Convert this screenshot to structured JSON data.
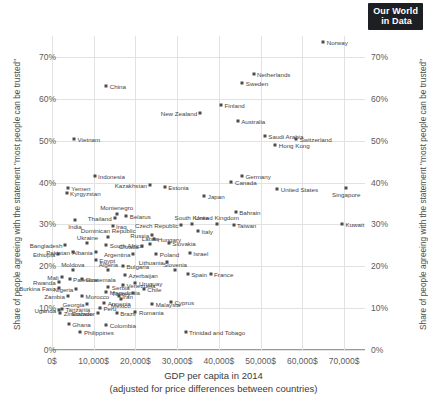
{
  "logo": {
    "line1": "Our World",
    "line2": "in Data"
  },
  "chart_data": {
    "type": "scatter",
    "title": "",
    "xlabel": "GDP per capita in 2014",
    "xlabel_sub": "(adjusted for price differences between countries)",
    "ylabel": "Share of people agreeing with the statement \"most people can be trusted\"",
    "xlim": [
      0,
      75000
    ],
    "ylim": [
      0,
      75
    ],
    "grid": true,
    "legend": "none",
    "xticks": [
      "0$",
      "10,000$",
      "20,000$",
      "30,000$",
      "40,000$",
      "50,000$",
      "60,000$",
      "70,000$"
    ],
    "xtick_values": [
      0,
      10000,
      20000,
      30000,
      40000,
      50000,
      60000,
      70000
    ],
    "yticks": [
      "0%",
      "10%",
      "20%",
      "30%",
      "40%",
      "50%",
      "60%",
      "70%"
    ],
    "ytick_values": [
      0,
      10,
      20,
      30,
      40,
      50,
      60,
      70
    ],
    "points": [
      {
        "name": "Norway",
        "x": 65000,
        "y": 73.5,
        "pos": "r"
      },
      {
        "name": "Netherlands",
        "x": 48300,
        "y": 66.0,
        "pos": "r"
      },
      {
        "name": "Sweden",
        "x": 45600,
        "y": 63.8,
        "pos": "r"
      },
      {
        "name": "China",
        "x": 13000,
        "y": 63.0,
        "pos": "r"
      },
      {
        "name": "Finland",
        "x": 40500,
        "y": 58.5,
        "pos": "r"
      },
      {
        "name": "New Zealand",
        "x": 35500,
        "y": 56.5,
        "pos": "l"
      },
      {
        "name": "Australia",
        "x": 44500,
        "y": 54.8,
        "pos": "r"
      },
      {
        "name": "Saudi Arabia",
        "x": 51000,
        "y": 51.2,
        "pos": "r"
      },
      {
        "name": "Switzerland",
        "x": 58500,
        "y": 50.5,
        "pos": "r"
      },
      {
        "name": "Hong Kong",
        "x": 53500,
        "y": 49.0,
        "pos": "r"
      },
      {
        "name": "Vietnam",
        "x": 5300,
        "y": 50.5,
        "pos": "r"
      },
      {
        "name": "Germany",
        "x": 45500,
        "y": 41.5,
        "pos": "r"
      },
      {
        "name": "Canada",
        "x": 43000,
        "y": 40.2,
        "pos": "r"
      },
      {
        "name": "United States",
        "x": 54000,
        "y": 38.5,
        "pos": "r"
      },
      {
        "name": "Singapore",
        "x": 70500,
        "y": 38.8,
        "pos": "b"
      },
      {
        "name": "Indonesia",
        "x": 10200,
        "y": 41.5,
        "pos": "r"
      },
      {
        "name": "Kazakhstan",
        "x": 23500,
        "y": 39.5,
        "pos": "l"
      },
      {
        "name": "Estonia",
        "x": 27000,
        "y": 39.0,
        "pos": "r"
      },
      {
        "name": "Yemen",
        "x": 3800,
        "y": 38.8,
        "pos": "r"
      },
      {
        "name": "Kyrgyzstan",
        "x": 3500,
        "y": 37.5,
        "pos": "r"
      },
      {
        "name": "Japan",
        "x": 36500,
        "y": 36.8,
        "pos": "r"
      },
      {
        "name": "Bahrain",
        "x": 44000,
        "y": 33.0,
        "pos": "r"
      },
      {
        "name": "Montenegro",
        "x": 15500,
        "y": 32.5,
        "pos": "t"
      },
      {
        "name": "Belarus",
        "x": 17800,
        "y": 32.0,
        "pos": "r"
      },
      {
        "name": "Thailand",
        "x": 15000,
        "y": 31.5,
        "pos": "l"
      },
      {
        "name": "United Kingdom",
        "x": 39500,
        "y": 30.2,
        "pos": "t"
      },
      {
        "name": "South Korea",
        "x": 33500,
        "y": 30.2,
        "pos": "t"
      },
      {
        "name": "Czech Republic",
        "x": 31000,
        "y": 29.8,
        "pos": "l"
      },
      {
        "name": "Taiwan",
        "x": 43500,
        "y": 29.8,
        "pos": "r"
      },
      {
        "name": "India",
        "x": 5500,
        "y": 31.0,
        "pos": "b"
      },
      {
        "name": "Iraq",
        "x": 14500,
        "y": 29.5,
        "pos": "r"
      },
      {
        "name": "Italy",
        "x": 35000,
        "y": 28.5,
        "pos": "r"
      },
      {
        "name": "Kuwait",
        "x": 69500,
        "y": 30.0,
        "pos": "r"
      },
      {
        "name": "Russia",
        "x": 24000,
        "y": 27.5,
        "pos": "l"
      },
      {
        "name": "Dominican Republic",
        "x": 13500,
        "y": 27.0,
        "pos": "t"
      },
      {
        "name": "Hungary",
        "x": 24500,
        "y": 26.5,
        "pos": "r"
      },
      {
        "name": "Latvia",
        "x": 23500,
        "y": 25.2,
        "pos": "t"
      },
      {
        "name": "Slovakia",
        "x": 28000,
        "y": 25.5,
        "pos": "r"
      },
      {
        "name": "South Africa",
        "x": 13000,
        "y": 25.0,
        "pos": "r"
      },
      {
        "name": "Croatia",
        "x": 21500,
        "y": 24.8,
        "pos": "l"
      },
      {
        "name": "Ukraine",
        "x": 8500,
        "y": 25.5,
        "pos": "t"
      },
      {
        "name": "Bangladesh",
        "x": 3200,
        "y": 25.0,
        "pos": "l"
      },
      {
        "name": "Pakistan",
        "x": 5000,
        "y": 23.5,
        "pos": "l"
      },
      {
        "name": "Albania",
        "x": 10500,
        "y": 23.5,
        "pos": "l"
      },
      {
        "name": "Ethiopia",
        "x": 1500,
        "y": 23.0,
        "pos": "l"
      },
      {
        "name": "Poland",
        "x": 25000,
        "y": 23.0,
        "pos": "r"
      },
      {
        "name": "Argentina",
        "x": 19500,
        "y": 23.0,
        "pos": "l"
      },
      {
        "name": "Israel",
        "x": 33000,
        "y": 23.2,
        "pos": "r"
      },
      {
        "name": "Egypt",
        "x": 10500,
        "y": 21.5,
        "pos": "r"
      },
      {
        "name": "Bulgaria",
        "x": 17000,
        "y": 20.0,
        "pos": "r"
      },
      {
        "name": "Lithuania",
        "x": 27500,
        "y": 21.0,
        "pos": "l"
      },
      {
        "name": "Slovenia",
        "x": 29500,
        "y": 19.0,
        "pos": "t"
      },
      {
        "name": "Moldova",
        "x": 5000,
        "y": 19.0,
        "pos": "t"
      },
      {
        "name": "Algeria",
        "x": 13500,
        "y": 19.0,
        "pos": "t"
      },
      {
        "name": "Spain",
        "x": 32500,
        "y": 18.2,
        "pos": "r"
      },
      {
        "name": "France",
        "x": 38000,
        "y": 18.2,
        "pos": "r"
      },
      {
        "name": "Azerbaijan",
        "x": 17500,
        "y": 17.8,
        "pos": "r"
      },
      {
        "name": "Mali",
        "x": 2300,
        "y": 17.5,
        "pos": "l"
      },
      {
        "name": "Palestine",
        "x": 4200,
        "y": 17.0,
        "pos": "r"
      },
      {
        "name": "Guatemala",
        "x": 7200,
        "y": 17.0,
        "pos": "r"
      },
      {
        "name": "Rwanda",
        "x": 1600,
        "y": 16.2,
        "pos": "l"
      },
      {
        "name": "Uruguay",
        "x": 20000,
        "y": 16.0,
        "pos": "r"
      },
      {
        "name": "Venezuela",
        "x": 17000,
        "y": 15.5,
        "pos": "r"
      },
      {
        "name": "Serbia",
        "x": 13500,
        "y": 15.0,
        "pos": "r"
      },
      {
        "name": "Chile",
        "x": 22000,
        "y": 14.5,
        "pos": "r"
      },
      {
        "name": "Nigeria",
        "x": 5800,
        "y": 14.5,
        "pos": "l"
      },
      {
        "name": "Burkina Faso",
        "x": 1600,
        "y": 14.8,
        "pos": "l"
      },
      {
        "name": "Macedonia",
        "x": 13000,
        "y": 13.8,
        "pos": "r"
      },
      {
        "name": "Turkey",
        "x": 19500,
        "y": 13.5,
        "pos": "l"
      },
      {
        "name": "Zambia",
        "x": 3800,
        "y": 13.0,
        "pos": "l"
      },
      {
        "name": "Morocco",
        "x": 7200,
        "y": 12.8,
        "pos": "r"
      },
      {
        "name": "Mexico",
        "x": 16500,
        "y": 12.3,
        "pos": "b"
      },
      {
        "name": "Iran",
        "x": 16000,
        "y": 13.0,
        "pos": "r"
      },
      {
        "name": "Georgia",
        "x": 8500,
        "y": 11.0,
        "pos": "l"
      },
      {
        "name": "Armenia",
        "x": 12500,
        "y": 11.2,
        "pos": "r"
      },
      {
        "name": "Malaysia",
        "x": 24000,
        "y": 11.0,
        "pos": "r"
      },
      {
        "name": "Cyprus",
        "x": 28500,
        "y": 11.5,
        "pos": "r"
      },
      {
        "name": "Peru",
        "x": 11500,
        "y": 10.0,
        "pos": "r"
      },
      {
        "name": "Uganda",
        "x": 1700,
        "y": 9.5,
        "pos": "l"
      },
      {
        "name": "Tanzania",
        "x": 2400,
        "y": 9.8,
        "pos": "r"
      },
      {
        "name": "Zimbabwe",
        "x": 2000,
        "y": 8.8,
        "pos": "r"
      },
      {
        "name": "Ecuador",
        "x": 11000,
        "y": 8.8,
        "pos": "l"
      },
      {
        "name": "Brazil",
        "x": 15500,
        "y": 8.8,
        "pos": "r"
      },
      {
        "name": "Romania",
        "x": 20000,
        "y": 9.0,
        "pos": "r"
      },
      {
        "name": "Ghana",
        "x": 4000,
        "y": 6.3,
        "pos": "r"
      },
      {
        "name": "Colombia",
        "x": 13000,
        "y": 6.0,
        "pos": "r"
      },
      {
        "name": "Philippines",
        "x": 6800,
        "y": 4.3,
        "pos": "r"
      },
      {
        "name": "Trinidad and Tobago",
        "x": 32000,
        "y": 4.3,
        "pos": "r"
      }
    ]
  }
}
